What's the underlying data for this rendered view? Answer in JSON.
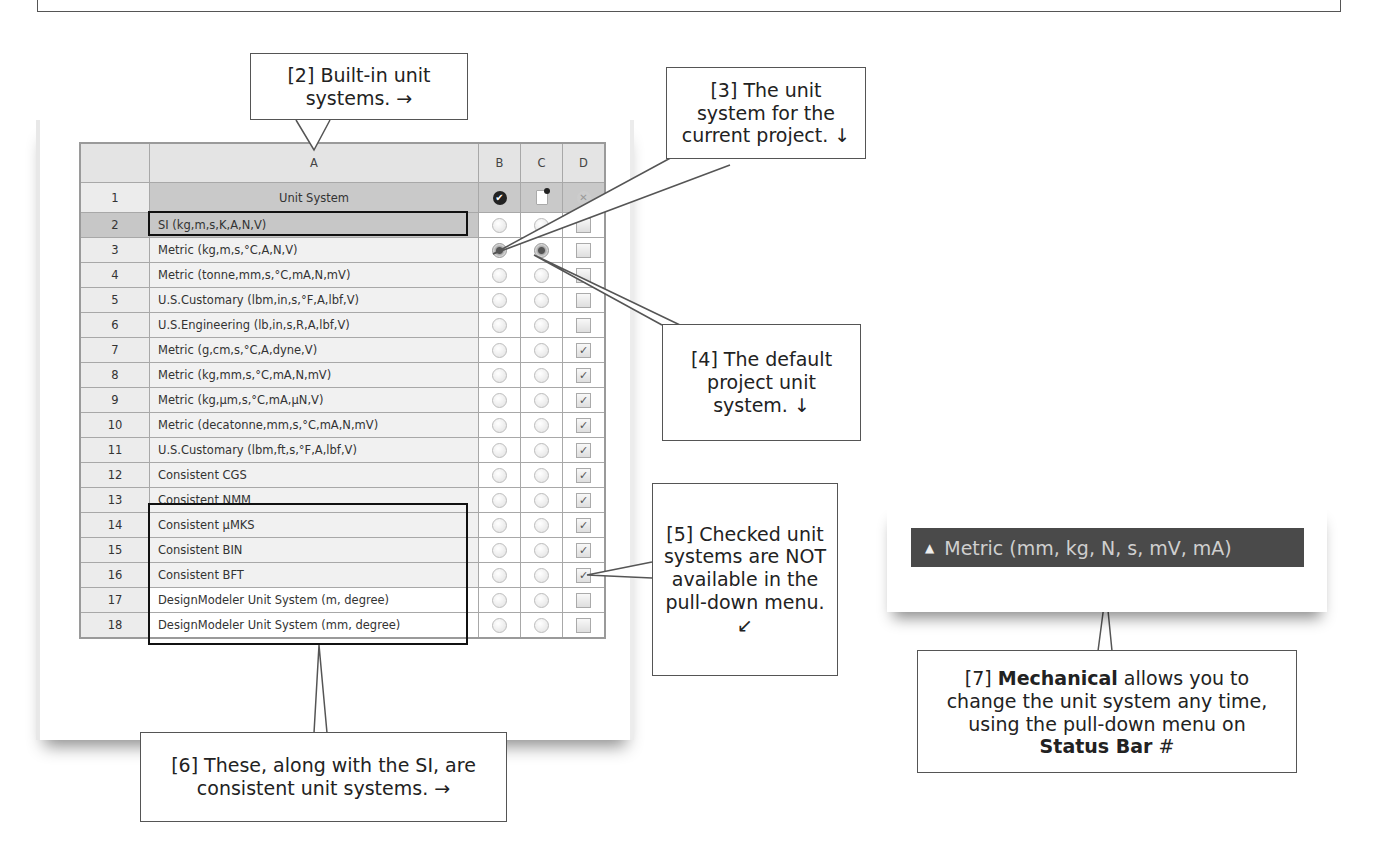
{
  "table": {
    "columns": [
      "",
      "A",
      "B",
      "C",
      "D"
    ],
    "header_row": {
      "num": "1",
      "label": "Unit System",
      "b_icon": "check-circle-icon",
      "c_icon": "document-icon",
      "d_icon": "x-circle-icon"
    },
    "rows": [
      {
        "num": "2",
        "label": "SI (kg,m,s,K,A,N,V)",
        "b": false,
        "c": false,
        "d": false
      },
      {
        "num": "3",
        "label": "Metric (kg,m,s,°C,A,N,V)",
        "b": true,
        "c": true,
        "d": false
      },
      {
        "num": "4",
        "label": "Metric (tonne,mm,s,°C,mA,N,mV)",
        "b": false,
        "c": false,
        "d": false
      },
      {
        "num": "5",
        "label": "U.S.Customary (lbm,in,s,°F,A,lbf,V)",
        "b": false,
        "c": false,
        "d": false
      },
      {
        "num": "6",
        "label": "U.S.Engineering (lb,in,s,R,A,lbf,V)",
        "b": false,
        "c": false,
        "d": false
      },
      {
        "num": "7",
        "label": "Metric (g,cm,s,°C,A,dyne,V)",
        "b": false,
        "c": false,
        "d": true
      },
      {
        "num": "8",
        "label": "Metric (kg,mm,s,°C,mA,N,mV)",
        "b": false,
        "c": false,
        "d": true
      },
      {
        "num": "9",
        "label": "Metric (kg,µm,s,°C,mA,µN,V)",
        "b": false,
        "c": false,
        "d": true
      },
      {
        "num": "10",
        "label": "Metric (decatonne,mm,s,°C,mA,N,mV)",
        "b": false,
        "c": false,
        "d": true
      },
      {
        "num": "11",
        "label": "U.S.Customary (lbm,ft,s,°F,A,lbf,V)",
        "b": false,
        "c": false,
        "d": true
      },
      {
        "num": "12",
        "label": "Consistent CGS",
        "b": false,
        "c": false,
        "d": true
      },
      {
        "num": "13",
        "label": "Consistent NMM",
        "b": false,
        "c": false,
        "d": true
      },
      {
        "num": "14",
        "label": "Consistent µMKS",
        "b": false,
        "c": false,
        "d": true
      },
      {
        "num": "15",
        "label": "Consistent BIN",
        "b": false,
        "c": false,
        "d": true
      },
      {
        "num": "16",
        "label": "Consistent BFT",
        "b": false,
        "c": false,
        "d": true
      },
      {
        "num": "17",
        "label": "DesignModeler Unit System (m, degree)",
        "b": false,
        "c": false,
        "d": false
      },
      {
        "num": "18",
        "label": "DesignModeler Unit System (mm, degree)",
        "b": false,
        "c": false,
        "d": false
      }
    ]
  },
  "callouts": {
    "c2": "[2] Built-in unit systems. →",
    "c3": "[3] The unit system for the current project. ↓",
    "c4": "[4] The default project unit system. ↓",
    "c5": "[5] Checked unit systems are NOT available in the pull-down menu. ↙",
    "c6": "[6] These, along with the SI, are consistent unit systems. →",
    "c7_prefix": "[7] ",
    "c7_bold1": "Mechanical",
    "c7_mid": " allows you to change the unit system any time, using the pull-down menu on ",
    "c7_bold2": "Status Bar",
    "c7_suffix": "  #"
  },
  "statusbar": {
    "icon": "triangle-up-icon",
    "label": "Metric (mm, kg, N, s, mV, mA)",
    "bg_color": "#4a4a4a"
  }
}
